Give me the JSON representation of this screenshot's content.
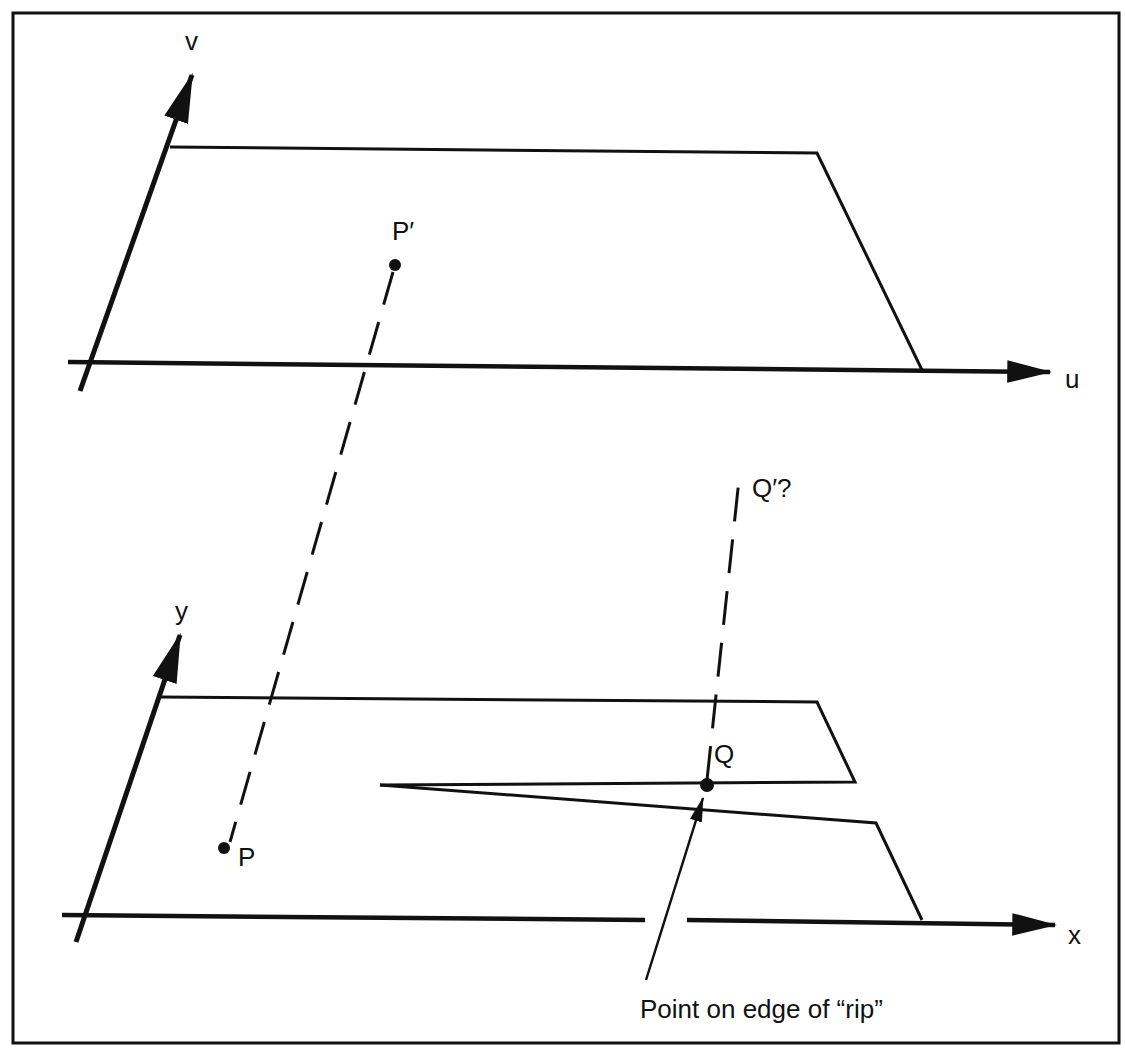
{
  "figure": {
    "type": "texture-mapping inverse mapping diagram",
    "ink_color": "#111111",
    "background": "#ffffff"
  },
  "top_panel": {
    "axes": {
      "horizontal": "u",
      "vertical": "v"
    },
    "point": {
      "label": "P′"
    }
  },
  "bottom_panel": {
    "axes": {
      "horizontal": "x",
      "vertical": "y"
    },
    "points": [
      {
        "label": "P"
      },
      {
        "label": "Q"
      }
    ],
    "projection_label": "Q′?",
    "annotation": "Point on edge of “rip”"
  }
}
